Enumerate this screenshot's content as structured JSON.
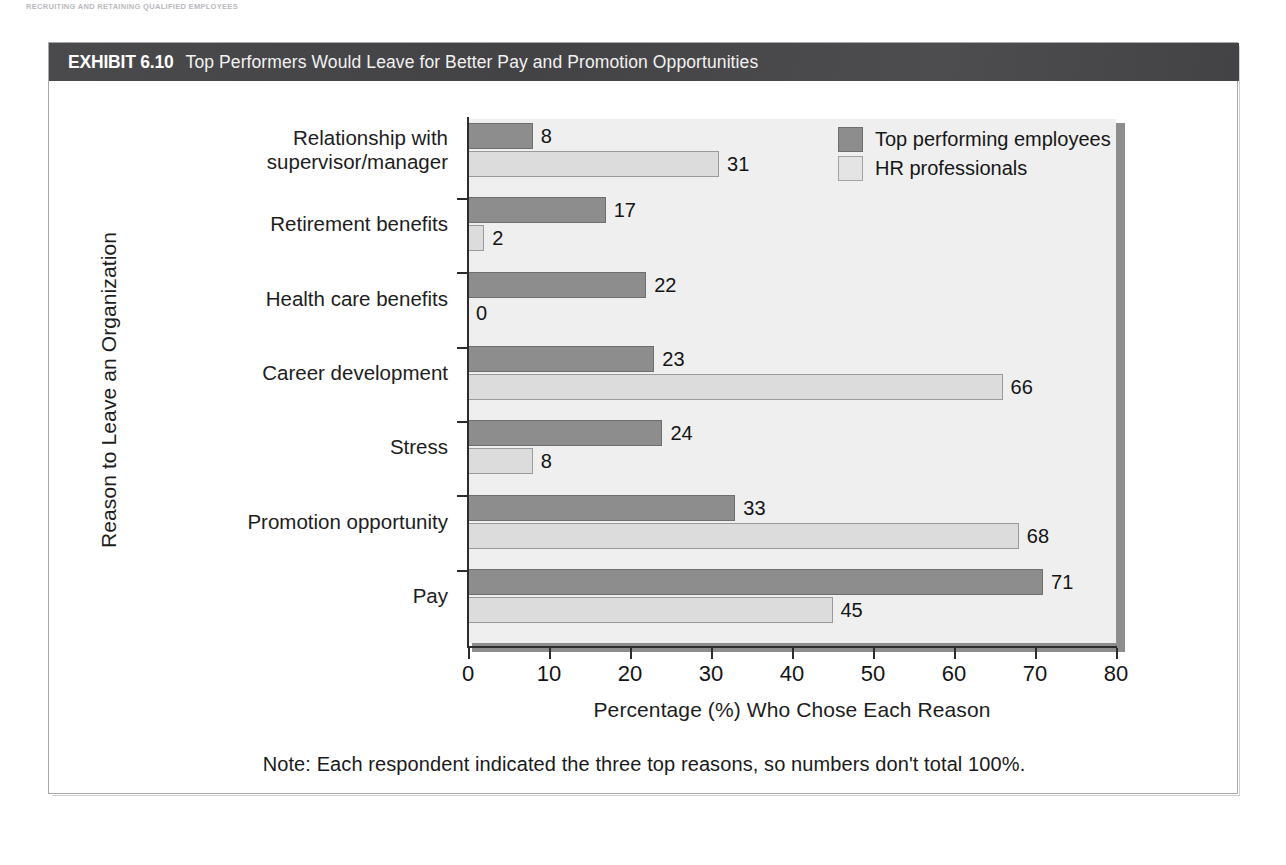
{
  "page": {
    "running_head": "RECRUITING AND RETAINING QUALIFIED EMPLOYEES",
    "page_number": ""
  },
  "exhibit": {
    "number": "EXHIBIT 6.10",
    "title": "Top Performers Would Leave for Better Pay and Promotion Opportunities",
    "note": "Note: Each respondent indicated the three top reasons, so numbers don't total 100%.",
    "title_bar_color": "#474749",
    "plot_background": "#efefef",
    "frame_border_color": "#a8a8ac"
  },
  "chart_data": {
    "type": "bar",
    "orientation": "horizontal",
    "title": "Top Performers Would Leave for Better Pay and Promotion Opportunities",
    "xlabel": "Percentage (%) Who Chose Each Reason",
    "ylabel": "Reason to Leave an Organization",
    "xlim": [
      0,
      80
    ],
    "xticks": [
      0,
      10,
      20,
      30,
      40,
      50,
      60,
      70,
      80
    ],
    "grid": false,
    "legend_position": "top-right",
    "categories": [
      "Relationship with\nsupervisor/manager",
      "Retirement benefits",
      "Health care benefits",
      "Career development",
      "Stress",
      "Promotion opportunity",
      "Pay"
    ],
    "series": [
      {
        "name": "Top performing employees",
        "color": "#8d8d8d",
        "values": [
          8,
          17,
          22,
          23,
          24,
          33,
          71
        ]
      },
      {
        "name": "HR professionals",
        "color": "#dcdcdc",
        "values": [
          31,
          2,
          0,
          66,
          8,
          68,
          45
        ]
      }
    ]
  }
}
